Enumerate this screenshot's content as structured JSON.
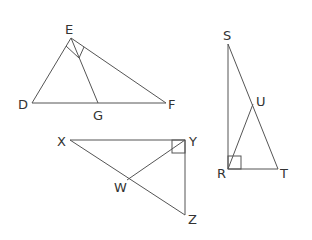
{
  "diagram": {
    "triangles": [
      {
        "name": "DEF",
        "vertices": {
          "D": [
            32,
            103
          ],
          "E": [
            71,
            38
          ],
          "F": [
            166,
            103
          ]
        },
        "segments": [
          [
            "D",
            "E"
          ],
          [
            "E",
            "F"
          ],
          [
            "D",
            "F"
          ],
          [
            "E",
            "G"
          ]
        ],
        "extra_points": {
          "G": [
            98,
            103
          ]
        },
        "right_angle_at": "E",
        "labels": {
          "D": "D",
          "E": "E",
          "F": "F",
          "G": "G"
        }
      },
      {
        "name": "XYZ",
        "vertices": {
          "X": [
            70,
            140
          ],
          "Y": [
            185,
            140
          ],
          "Z": [
            185,
            215
          ]
        },
        "segments": [
          [
            "X",
            "Y"
          ],
          [
            "Y",
            "Z"
          ],
          [
            "X",
            "Z"
          ],
          [
            "Y",
            "W"
          ]
        ],
        "extra_points": {
          "W": [
            127,
            180
          ]
        },
        "right_angle_at": "Y",
        "labels": {
          "X": "X",
          "Y": "Y",
          "Z": "Z",
          "W": "W"
        }
      },
      {
        "name": "SRT",
        "vertices": {
          "S": [
            228,
            44
          ],
          "R": [
            228,
            169
          ],
          "T": [
            278,
            169
          ]
        },
        "segments": [
          [
            "S",
            "R"
          ],
          [
            "R",
            "T"
          ],
          [
            "S",
            "T"
          ],
          [
            "R",
            "U"
          ]
        ],
        "extra_points": {
          "U": [
            253,
            104
          ]
        },
        "right_angle_at": "R",
        "labels": {
          "S": "S",
          "R": "R",
          "T": "T",
          "U": "U"
        }
      }
    ],
    "colors": {
      "line": "#555555",
      "label": "#333333",
      "background": "#ffffff"
    }
  }
}
